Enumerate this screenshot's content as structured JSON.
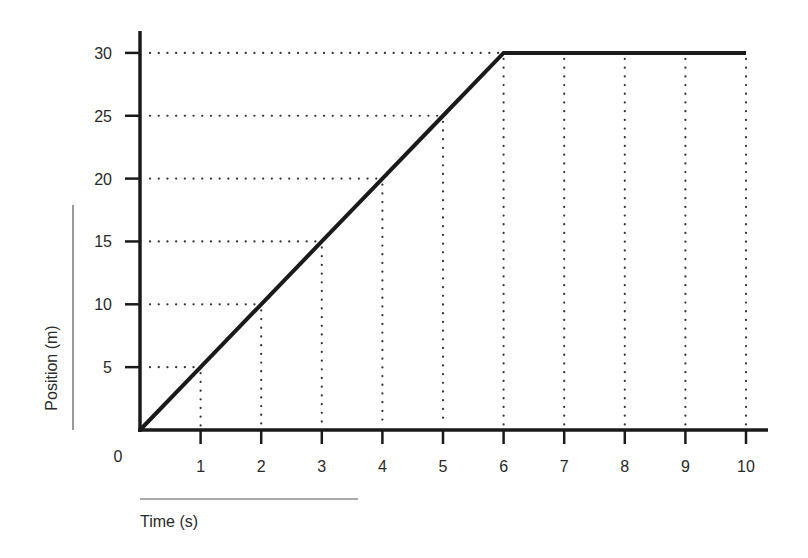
{
  "chart_data": {
    "type": "line",
    "title": "",
    "xlabel": "Time (s)",
    "ylabel": "Position (m)",
    "origin_label": "0",
    "x": [
      0,
      1,
      2,
      3,
      4,
      5,
      6,
      7,
      8,
      9,
      10
    ],
    "series": [
      {
        "name": "Position",
        "values": [
          0,
          5,
          10,
          15,
          20,
          25,
          30,
          30,
          30,
          30,
          30
        ]
      }
    ],
    "xticks": [
      "1",
      "2",
      "3",
      "4",
      "5",
      "6",
      "7",
      "8",
      "9",
      "10"
    ],
    "yticks": [
      "5",
      "10",
      "15",
      "20",
      "25",
      "30"
    ],
    "xlim": [
      0,
      10
    ],
    "ylim": [
      0,
      30
    ],
    "grid": "dotted guide lines from each data point to the axes",
    "legend": "none"
  },
  "colors": {
    "line": "#1a1a1a",
    "axis": "#1a1a1a",
    "guides": "#333333",
    "text": "#2a2a2a"
  }
}
